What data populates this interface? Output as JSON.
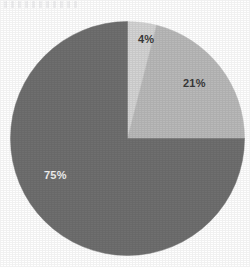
{
  "canvas": {
    "width": 250,
    "height": 267,
    "background": "#ffffff"
  },
  "artifact": {
    "name": "scan-smudge",
    "description": "faint horizontal scan artifact at top-left"
  },
  "geometry": {
    "center_x": 127.5,
    "center_y": 138.5,
    "radius": 117,
    "start_angle_deg": 0
  },
  "chart_data": {
    "type": "pie",
    "title": "",
    "subtitle": "",
    "xlabel": "",
    "ylabel": "",
    "grid": false,
    "legend": "none",
    "start_angle_deg": 0,
    "direction": "clockwise",
    "categories": [
      "Segment 1",
      "Segment 2",
      "Segment 3"
    ],
    "values": [
      4,
      21,
      75
    ],
    "unit": "%",
    "labels": [
      "4%",
      "21%",
      "75%"
    ],
    "colors": [
      "#d4d4d4",
      "#b9b9b9",
      "#6f6f6f"
    ],
    "slices": [
      {
        "label": "4%",
        "value": 4,
        "color": "#d4d4d4",
        "start_deg": 0,
        "end_deg": 14.4,
        "label_color": "#3a3a3a",
        "label_x": 138,
        "label_y": 33
      },
      {
        "label": "21%",
        "value": 21,
        "color": "#b9b9b9",
        "start_deg": 14.4,
        "end_deg": 90,
        "label_color": "#3a3a3a",
        "label_x": 183,
        "label_y": 77
      },
      {
        "label": "75%",
        "value": 75,
        "color": "#6f6f6f",
        "start_deg": 90,
        "end_deg": 360,
        "label_color": "#f2f2f2",
        "label_x": 44,
        "label_y": 169
      }
    ]
  }
}
